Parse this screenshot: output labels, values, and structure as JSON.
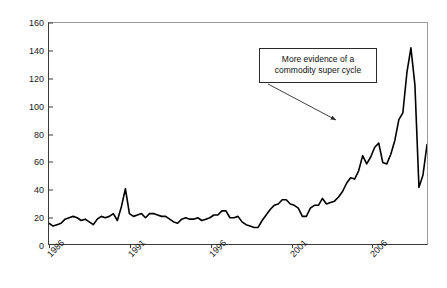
{
  "chart_data": {
    "type": "line",
    "title": "",
    "subtitle": "",
    "xlabel": "",
    "ylabel": "Dollar Price per Barrel",
    "ylim": [
      0,
      160
    ],
    "xlim": [
      1986,
      2009.5
    ],
    "grid": false,
    "legend": null,
    "y_ticks": [
      0,
      20,
      40,
      60,
      80,
      100,
      120,
      140,
      160
    ],
    "y_tick_labels": [
      "0",
      "20",
      "40",
      "60",
      "80",
      "100",
      "120",
      "140",
      "160"
    ],
    "x_ticks": [
      1986,
      1991,
      1996,
      2001,
      2006
    ],
    "x_tick_labels": [
      "1986",
      "1991",
      "1996",
      "2001",
      "2006"
    ],
    "x_tick_label_rotation": -45,
    "line_color": "#000000",
    "line_width": 1.6,
    "series": [
      {
        "name": "Dollar Price per Barrel",
        "x": [
          1986.0,
          1986.25,
          1986.5,
          1986.75,
          1987.0,
          1987.25,
          1987.5,
          1987.75,
          1988.0,
          1988.25,
          1988.5,
          1988.75,
          1989.0,
          1989.25,
          1989.5,
          1989.75,
          1990.0,
          1990.25,
          1990.5,
          1990.75,
          1991.0,
          1991.25,
          1991.5,
          1991.75,
          1992.0,
          1992.25,
          1992.5,
          1992.75,
          1993.0,
          1993.25,
          1993.5,
          1993.75,
          1994.0,
          1994.25,
          1994.5,
          1994.75,
          1995.0,
          1995.25,
          1995.5,
          1995.75,
          1996.0,
          1996.25,
          1996.5,
          1996.75,
          1997.0,
          1997.25,
          1997.5,
          1997.75,
          1998.0,
          1998.25,
          1998.5,
          1998.75,
          1999.0,
          1999.25,
          1999.5,
          1999.75,
          2000.0,
          2000.25,
          2000.5,
          2000.75,
          2001.0,
          2001.25,
          2001.5,
          2001.75,
          2002.0,
          2002.25,
          2002.5,
          2002.75,
          2003.0,
          2003.25,
          2003.5,
          2003.75,
          2004.0,
          2004.25,
          2004.5,
          2004.75,
          2005.0,
          2005.25,
          2005.5,
          2005.75,
          2006.0,
          2006.25,
          2006.5,
          2006.75,
          2007.0,
          2007.25,
          2007.5,
          2007.75,
          2008.0,
          2008.25,
          2008.5,
          2008.75,
          2009.0,
          2009.25,
          2009.5
        ],
        "values": [
          15,
          13,
          14,
          15,
          18,
          19,
          20,
          19,
          17,
          18,
          16,
          14,
          18,
          20,
          19,
          20,
          22,
          17,
          27,
          40,
          22,
          20,
          21,
          22,
          19,
          22,
          22,
          21,
          20,
          20,
          18,
          16,
          15,
          18,
          19,
          18,
          18,
          19,
          17,
          18,
          19,
          21,
          21,
          24,
          24,
          19,
          19,
          20,
          16,
          14,
          13,
          12,
          12,
          17,
          21,
          25,
          28,
          29,
          32,
          32,
          29,
          28,
          26,
          20,
          20,
          26,
          28,
          28,
          33,
          29,
          30,
          31,
          34,
          38,
          44,
          48,
          47,
          53,
          64,
          58,
          63,
          70,
          73,
          59,
          58,
          65,
          75,
          90,
          95,
          124,
          142,
          115,
          41,
          50,
          72
        ]
      }
    ],
    "annotations": [
      {
        "name": "super-cycle-callout",
        "text_line_1": "More evidence of a",
        "text_line_2": "commodity super cycle",
        "box": true,
        "arrow": true,
        "arrow_from": [
          268,
          84
        ],
        "arrow_to": [
          336,
          120
        ]
      }
    ]
  }
}
